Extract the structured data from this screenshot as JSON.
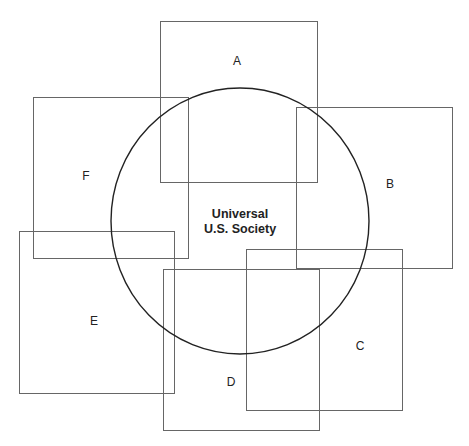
{
  "diagram": {
    "type": "overlap-diagram",
    "center_circle": {
      "label_line1": "Universal",
      "label_line2": "U.S. Society",
      "cx": 240,
      "cy": 221,
      "rx": 129,
      "ry": 133
    },
    "boxes": [
      {
        "id": "A",
        "label": "A",
        "x": 160,
        "y": 21,
        "w": 157,
        "h": 161,
        "lx": 237,
        "ly": 65
      },
      {
        "id": "B",
        "label": "B",
        "x": 296,
        "y": 107,
        "w": 156,
        "h": 161,
        "lx": 390,
        "ly": 188
      },
      {
        "id": "C",
        "label": "C",
        "x": 246,
        "y": 249,
        "w": 156,
        "h": 161,
        "lx": 360,
        "ly": 350
      },
      {
        "id": "D",
        "label": "D",
        "x": 163,
        "y": 269,
        "w": 156,
        "h": 161,
        "lx": 231,
        "ly": 386
      },
      {
        "id": "E",
        "label": "E",
        "x": 19,
        "y": 231,
        "w": 155,
        "h": 162,
        "lx": 94,
        "ly": 325
      },
      {
        "id": "F",
        "label": "F",
        "x": 33,
        "y": 97,
        "w": 155,
        "h": 161,
        "lx": 86,
        "ly": 180
      }
    ]
  }
}
